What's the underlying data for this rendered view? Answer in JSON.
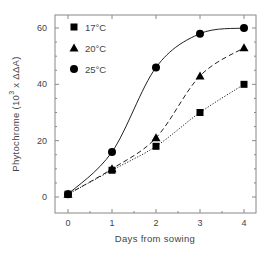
{
  "chart_data": {
    "type": "line",
    "title": "",
    "xlabel": "Days from sowing",
    "ylabel": "Phytochrome",
    "ylabel_units": "(10",
    "ylabel_exp": "3",
    "ylabel_units_tail": " x ΔΔA)",
    "xlim": [
      0,
      4
    ],
    "ylim": [
      -5,
      65
    ],
    "x_ticks": [
      0,
      1,
      2,
      3,
      4
    ],
    "y_ticks": [
      0,
      20,
      40,
      60
    ],
    "x_tick_labels": [
      "0",
      "1",
      "2",
      "3",
      "4"
    ],
    "y_tick_labels": [
      "0",
      "20",
      "40",
      "60"
    ],
    "grid": false,
    "legend_position": "top-left",
    "series": [
      {
        "name": "17°C",
        "marker": "square",
        "line": "dotted",
        "x": [
          0,
          1,
          2,
          3,
          4
        ],
        "values": [
          1,
          9.5,
          18,
          30,
          40
        ]
      },
      {
        "name": "20°C",
        "marker": "triangle",
        "line": "dashed",
        "x": [
          0,
          1,
          2,
          3,
          4
        ],
        "values": [
          1,
          10,
          21,
          43,
          53
        ]
      },
      {
        "name": "25°C",
        "marker": "circle",
        "line": "solid",
        "x": [
          0,
          1,
          2,
          3,
          4
        ],
        "values": [
          1,
          16,
          46,
          58,
          60
        ]
      }
    ]
  }
}
